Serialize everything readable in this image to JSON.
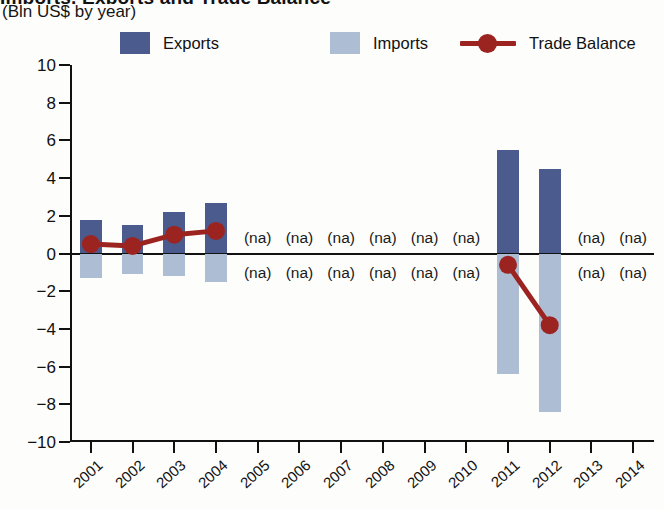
{
  "header": {
    "title": "Imports, Exports and Trade Balance",
    "subtitle": "(Bln US$ by year)"
  },
  "legend": {
    "position": "top",
    "items": [
      {
        "label": "Exports",
        "type": "swatch",
        "color": "#4b5b8e",
        "icon": "square-swatch-icon"
      },
      {
        "label": "Imports",
        "type": "swatch",
        "color": "#adbdd4",
        "icon": "square-swatch-icon"
      },
      {
        "label": "Trade Balance",
        "type": "line-marker",
        "color": "#9c2420",
        "icon": "line-marker-icon"
      }
    ]
  },
  "colors": {
    "exports": "#4b5b8e",
    "imports": "#adbdd4",
    "trade_balance": "#9c2420",
    "axis": "#111111",
    "background": "#fdfdfc"
  },
  "na_text": "(na)",
  "chart_data": {
    "type": "bar",
    "title": "Imports, Exports and Trade Balance",
    "subtitle": "(Bln US$ by year)",
    "xlabel": "",
    "ylabel": "(Bln US$ by year)",
    "ylim": [
      -10,
      10
    ],
    "ytick_values": [
      10,
      8,
      6,
      4,
      2,
      0,
      -2,
      -4,
      -6,
      -8,
      -10
    ],
    "ytick_labels": [
      "10",
      "8",
      "6",
      "4",
      "2",
      "0",
      "−2",
      "−4",
      "−6",
      "−8",
      "−10"
    ],
    "grid": false,
    "legend_position": "top",
    "categories": [
      "2001",
      "2002",
      "2003",
      "2004",
      "2005",
      "2006",
      "2007",
      "2008",
      "2009",
      "2010",
      "2011",
      "2012",
      "2013",
      "2014"
    ],
    "series": [
      {
        "name": "Exports",
        "type": "bar",
        "color": "#4b5b8e",
        "values": [
          1.8,
          1.5,
          2.2,
          2.7,
          null,
          null,
          null,
          null,
          null,
          null,
          5.5,
          4.5,
          null,
          null
        ]
      },
      {
        "name": "Imports",
        "type": "bar",
        "color": "#adbdd4",
        "values": [
          -1.3,
          -1.1,
          -1.2,
          -1.5,
          null,
          null,
          null,
          null,
          null,
          null,
          -6.4,
          -8.4,
          null,
          null
        ]
      },
      {
        "name": "Trade Balance",
        "type": "line",
        "color": "#9c2420",
        "values": [
          0.5,
          0.4,
          1.0,
          1.2,
          null,
          null,
          null,
          null,
          null,
          null,
          -0.6,
          -3.8,
          null,
          null
        ]
      }
    ],
    "na_categories": [
      "2005",
      "2006",
      "2007",
      "2008",
      "2009",
      "2010",
      "2013",
      "2014"
    ],
    "na_label": "(na)",
    "na_label_positions": [
      "above-zero",
      "below-zero"
    ]
  }
}
